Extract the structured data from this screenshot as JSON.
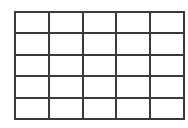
{
  "grid": {
    "rows": 5,
    "columns": 5,
    "line_color": "#3a3a3a",
    "background": "#ffffff",
    "cells": [
      [
        "",
        "",
        "",
        "",
        ""
      ],
      [
        "",
        "",
        "",
        "",
        ""
      ],
      [
        "",
        "",
        "",
        "",
        ""
      ],
      [
        "",
        "",
        "",
        "",
        ""
      ],
      [
        "",
        "",
        "",
        "",
        ""
      ]
    ]
  }
}
